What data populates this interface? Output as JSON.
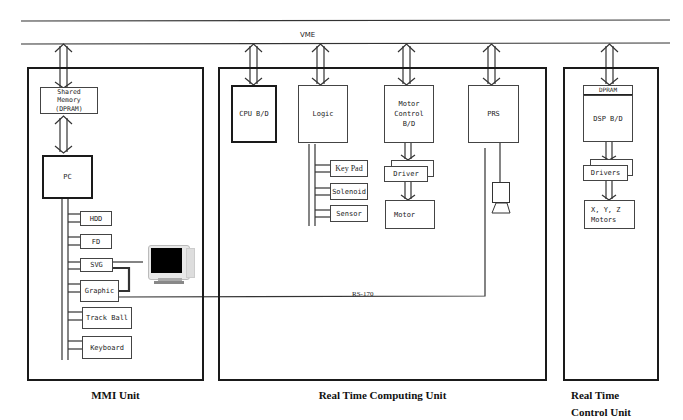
{
  "bus": {
    "label": "VME"
  },
  "units": {
    "mmi": {
      "label": "MMI Unit",
      "shared_memory": "Shared\nMemory\n(DPRAM)",
      "pc": "PC",
      "peripherals": [
        "HDD",
        "FD",
        "SVG",
        "Graphic",
        "Track Ball",
        "Keyboard"
      ],
      "monitor_icon": "monitor-icon"
    },
    "rtcu": {
      "label": "Real Time Computing Unit",
      "cpu": "CPU B/D",
      "logic": "Logic",
      "logic_peripherals": [
        "Key Pad",
        "Solenoid",
        "Sensor"
      ],
      "motor_control": "Motor\nControl\nB/D",
      "driver": "Driver",
      "motor": "Motor",
      "prs": "PRS",
      "camera_icon": "camera-icon"
    },
    "rtctl": {
      "label": "Real Time\nControl Unit",
      "dpram": "DPRAM",
      "dsp": "DSP B/D",
      "drivers": "Drivers",
      "motors": "X, Y, Z\nMotors"
    }
  },
  "links": {
    "video": "RS-170"
  }
}
